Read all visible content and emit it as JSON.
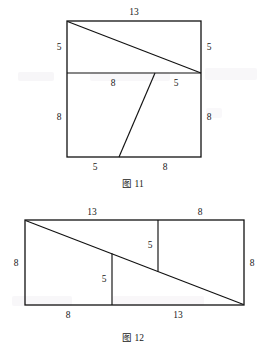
{
  "page": {
    "background_color": "#ffffff",
    "ink_color": "#111111",
    "width": 266,
    "height": 352
  },
  "figures": [
    {
      "id": "figure-11",
      "caption": "图 11",
      "shape": "square-with-diagonal-and-slant",
      "labels": [
        {
          "name": "top-side-length",
          "text": "13"
        },
        {
          "name": "upper-left-side-length",
          "text": "5"
        },
        {
          "name": "upper-right-side-length",
          "text": "5"
        },
        {
          "name": "divider-left-segment-length",
          "text": "8"
        },
        {
          "name": "divider-right-segment-length",
          "text": "5"
        },
        {
          "name": "lower-left-side-length",
          "text": "8"
        },
        {
          "name": "lower-right-side-length",
          "text": "8"
        },
        {
          "name": "bottom-left-segment-length",
          "text": "5"
        },
        {
          "name": "bottom-right-segment-length",
          "text": "8"
        }
      ]
    },
    {
      "id": "figure-12",
      "caption": "图 12",
      "shape": "rectangle-with-diagonal-and-two-verticals",
      "labels": [
        {
          "name": "top-left-segment-length",
          "text": "13"
        },
        {
          "name": "top-right-segment-length",
          "text": "8"
        },
        {
          "name": "left-side-length",
          "text": "8"
        },
        {
          "name": "right-side-length",
          "text": "8"
        },
        {
          "name": "right-vertical-length",
          "text": "5"
        },
        {
          "name": "left-vertical-length",
          "text": "5"
        },
        {
          "name": "bottom-left-segment-length",
          "text": "8"
        },
        {
          "name": "bottom-right-segment-length",
          "text": "13"
        }
      ]
    }
  ],
  "figure_11": {
    "caption": "图 11",
    "top": "13",
    "upper_left": "5",
    "upper_right": "5",
    "divider_left": "8",
    "divider_right": "5",
    "lower_left": "8",
    "lower_right": "8",
    "bottom_left": "5",
    "bottom_right": "8"
  },
  "figure_12": {
    "caption": "图 12",
    "top_left": "13",
    "top_right": "8",
    "left_side": "8",
    "right_side": "8",
    "right_vertical": "5",
    "left_vertical": "5",
    "bottom_left": "8",
    "bottom_right": "13"
  }
}
